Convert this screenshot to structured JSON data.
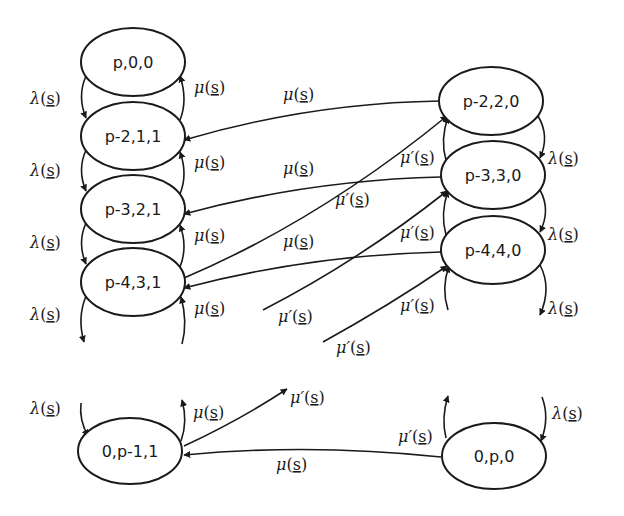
{
  "diagram": {
    "type": "state-transition-diagram",
    "colors": {
      "stroke": "#1a1a1a",
      "background": "#ffffff"
    },
    "nodes": [
      {
        "id": "n_p00",
        "label": "p,0,0",
        "cx": 133,
        "cy": 62
      },
      {
        "id": "n_p211",
        "label": "p-2,1,1",
        "cx": 133,
        "cy": 136
      },
      {
        "id": "n_p321",
        "label": "p-3,2,1",
        "cx": 133,
        "cy": 209
      },
      {
        "id": "n_p431",
        "label": "p-4,3,1",
        "cx": 133,
        "cy": 282
      },
      {
        "id": "n_p220",
        "label": "p-2,2,0",
        "cx": 491,
        "cy": 101
      },
      {
        "id": "n_p330",
        "label": "p-3,3,0",
        "cx": 493,
        "cy": 175
      },
      {
        "id": "n_p440",
        "label": "p-4,4,0",
        "cx": 493,
        "cy": 250
      },
      {
        "id": "n_0p11",
        "label": "0,p-1,1",
        "cx": 130,
        "cy": 451
      },
      {
        "id": "n_0p0",
        "label": "0,p,0",
        "cx": 494,
        "cy": 456
      }
    ],
    "labels": [
      {
        "id": "l1",
        "rate": "λ",
        "prime": "",
        "arg": "s",
        "x": 30,
        "y": 104
      },
      {
        "id": "l2",
        "rate": "μ",
        "prime": "",
        "arg": "s",
        "x": 194,
        "y": 93
      },
      {
        "id": "l3",
        "rate": "μ",
        "prime": "",
        "arg": "s",
        "x": 283,
        "y": 100
      },
      {
        "id": "l4",
        "rate": "λ",
        "prime": "",
        "arg": "s",
        "x": 30,
        "y": 176
      },
      {
        "id": "l5",
        "rate": "μ",
        "prime": "",
        "arg": "s",
        "x": 194,
        "y": 168
      },
      {
        "id": "l6",
        "rate": "μ",
        "prime": "",
        "arg": "s",
        "x": 283,
        "y": 174
      },
      {
        "id": "l7",
        "rate": "μ",
        "prime": "′",
        "arg": "s",
        "x": 400,
        "y": 163
      },
      {
        "id": "l8",
        "rate": "μ",
        "prime": "′",
        "arg": "s",
        "x": 335,
        "y": 205
      },
      {
        "id": "l9",
        "rate": "λ",
        "prime": "",
        "arg": "s",
        "x": 30,
        "y": 248
      },
      {
        "id": "l10",
        "rate": "μ",
        "prime": "",
        "arg": "s",
        "x": 194,
        "y": 241
      },
      {
        "id": "l11",
        "rate": "μ",
        "prime": "",
        "arg": "s",
        "x": 283,
        "y": 247
      },
      {
        "id": "l12",
        "rate": "μ",
        "prime": "′",
        "arg": "s",
        "x": 400,
        "y": 238
      },
      {
        "id": "l13",
        "rate": "λ",
        "prime": "",
        "arg": "s",
        "x": 30,
        "y": 320
      },
      {
        "id": "l14",
        "rate": "μ",
        "prime": "",
        "arg": "s",
        "x": 194,
        "y": 314
      },
      {
        "id": "l15",
        "rate": "μ",
        "prime": "′",
        "arg": "s",
        "x": 278,
        "y": 322
      },
      {
        "id": "l16",
        "rate": "μ",
        "prime": "′",
        "arg": "s",
        "x": 400,
        "y": 311
      },
      {
        "id": "l17",
        "rate": "μ",
        "prime": "′",
        "arg": "s",
        "x": 336,
        "y": 353
      },
      {
        "id": "l18",
        "rate": "λ",
        "prime": "",
        "arg": "s",
        "x": 548,
        "y": 164
      },
      {
        "id": "l19",
        "rate": "λ",
        "prime": "",
        "arg": "s",
        "x": 548,
        "y": 240
      },
      {
        "id": "l20",
        "rate": "λ",
        "prime": "",
        "arg": "s",
        "x": 548,
        "y": 314
      },
      {
        "id": "l21",
        "rate": "λ",
        "prime": "",
        "arg": "s",
        "x": 30,
        "y": 414
      },
      {
        "id": "l22",
        "rate": "μ",
        "prime": "",
        "arg": "s",
        "x": 193,
        "y": 418
      },
      {
        "id": "l23",
        "rate": "μ",
        "prime": "′",
        "arg": "s",
        "x": 290,
        "y": 403
      },
      {
        "id": "l24",
        "rate": "μ",
        "prime": "",
        "arg": "s",
        "x": 276,
        "y": 470
      },
      {
        "id": "l25",
        "rate": "μ",
        "prime": "′",
        "arg": "s",
        "x": 398,
        "y": 442
      },
      {
        "id": "l26",
        "rate": "λ",
        "prime": "",
        "arg": "s",
        "x": 552,
        "y": 419
      }
    ]
  }
}
